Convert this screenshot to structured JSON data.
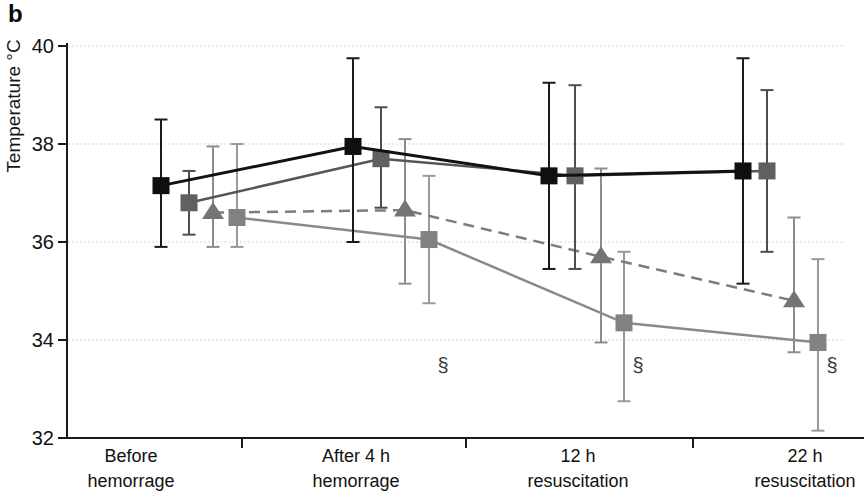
{
  "panel_label": "b",
  "chart_data": {
    "type": "line",
    "title": "",
    "xlabel": "",
    "ylabel": "Temperature °C",
    "ylim": [
      32,
      40
    ],
    "yticks": [
      40,
      38,
      36,
      34,
      32
    ],
    "grid": "horizontal-dotted",
    "legend": "none",
    "error_bars": true,
    "categories": [
      {
        "line1": "Before",
        "line2": "hemorrage"
      },
      {
        "line1": "After 4 h",
        "line2": "hemorrage"
      },
      {
        "line1": "12 h",
        "line2": "resuscitation"
      },
      {
        "line1": "22 h",
        "line2": "resuscitation"
      }
    ],
    "series": [
      {
        "name": "series-lightgray-square",
        "marker": "square",
        "line_style": "solid",
        "line_color": "#8a8a8a",
        "marker_color": "#828282",
        "err_color": "#9a9a9a",
        "values": [
          36.5,
          36.05,
          34.35,
          33.95
        ],
        "err_low": [
          35.9,
          34.75,
          32.75,
          32.15
        ],
        "err_high": [
          38.0,
          37.35,
          35.8,
          35.65
        ]
      },
      {
        "name": "series-gray-triangle",
        "marker": "triangle",
        "line_style": "dashed",
        "line_color": "#7d7d7d",
        "marker_color": "#747474",
        "err_color": "#8c8c8c",
        "values": [
          36.6,
          36.65,
          35.7,
          34.8
        ],
        "err_low": [
          35.9,
          35.15,
          33.95,
          33.75
        ],
        "err_high": [
          37.95,
          38.1,
          37.5,
          36.5
        ]
      },
      {
        "name": "series-darkgray-square",
        "marker": "square",
        "line_style": "solid",
        "line_color": "#565656",
        "marker_color": "#606060",
        "err_color": "#4e4e4e",
        "values": [
          36.8,
          37.7,
          37.35,
          37.45
        ],
        "err_low": [
          36.15,
          36.7,
          35.45,
          35.8
        ],
        "err_high": [
          37.45,
          38.75,
          39.2,
          39.1
        ]
      },
      {
        "name": "series-black-square",
        "marker": "square",
        "line_style": "solid",
        "line_color": "#111111",
        "marker_color": "#0f0f0f",
        "err_color": "#1a1a1a",
        "values": [
          37.15,
          37.95,
          37.35,
          37.45
        ],
        "err_low": [
          35.9,
          36.0,
          35.45,
          35.15
        ],
        "err_high": [
          38.5,
          39.75,
          39.25,
          39.75
        ]
      }
    ],
    "annotations": [
      {
        "symbol": "§",
        "series": "series-lightgray-square",
        "category_index": 1,
        "at_value": 33.5
      },
      {
        "symbol": "§",
        "series": "series-lightgray-square",
        "category_index": 2,
        "at_value": 33.5
      },
      {
        "symbol": "§",
        "series": "series-lightgray-square",
        "category_index": 3,
        "at_value": 33.5
      }
    ]
  },
  "layout": {
    "width": 864,
    "height": 503,
    "axis_x": 67,
    "y_top": 46,
    "px_per_unit": 49,
    "axis_bottom_y": 438,
    "grid_ticks": [
      40,
      38,
      36,
      34
    ],
    "grid_x_end": 845,
    "x_ticks": [
      242,
      466,
      693
    ],
    "category_label_centers": [
      131,
      356,
      578,
      805
    ],
    "category_label_y": [
      462,
      487
    ],
    "series_x": {
      "series-black-square": [
        161,
        353,
        549,
        743
      ],
      "series-darkgray-square": [
        189,
        381,
        575,
        767
      ],
      "series-gray-triangle": [
        213,
        405,
        601,
        794
      ],
      "series-lightgray-square": [
        237,
        429,
        624,
        818
      ]
    },
    "annotation_dx": 14,
    "colors": {
      "axis": "#1a1a1a",
      "grid": "#d6d6d6",
      "tick_label": "#111111",
      "annotation": "#3a3a3a"
    },
    "marker": {
      "square_size": 17,
      "tri_w": 22,
      "tri_h": 17
    },
    "cap_half_width": 6.5
  }
}
